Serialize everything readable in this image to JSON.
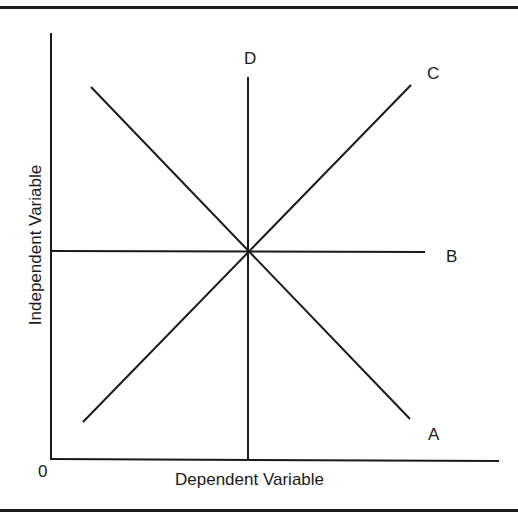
{
  "diagram": {
    "x_axis_label": "Dependent Variable",
    "y_axis_label": "Independent Variable",
    "origin_label": "0",
    "lines": [
      {
        "label": "A",
        "description": "negative slope",
        "x1": 91,
        "y1": 87,
        "x2": 410,
        "y2": 419
      },
      {
        "label": "B",
        "description": "horizontal",
        "x1": 51,
        "y1": 251,
        "x2": 425,
        "y2": 251
      },
      {
        "label": "C",
        "description": "positive slope",
        "x1": 83,
        "y1": 422,
        "x2": 411,
        "y2": 85
      },
      {
        "label": "D",
        "description": "vertical",
        "x1": 248,
        "y1": 77,
        "x2": 248,
        "y2": 459
      }
    ],
    "colors": {
      "ink": "#1a1a1a",
      "background": "#ffffff"
    }
  }
}
